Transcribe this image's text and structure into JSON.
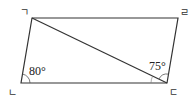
{
  "figure": {
    "type": "parallelogram",
    "vertices": {
      "top_left": {
        "label": "ㄱ"
      },
      "bottom_left": {
        "label": "ㄴ"
      },
      "bottom_right": {
        "label": "ㄷ"
      },
      "top_right": {
        "label": "ㄹ"
      }
    },
    "diagonal": "ㄱㄷ",
    "angles": {
      "at_bottom_left": "80°",
      "at_bottom_right": "75°"
    },
    "colors": {
      "stroke": "#333333",
      "background": "#ffffff"
    }
  }
}
